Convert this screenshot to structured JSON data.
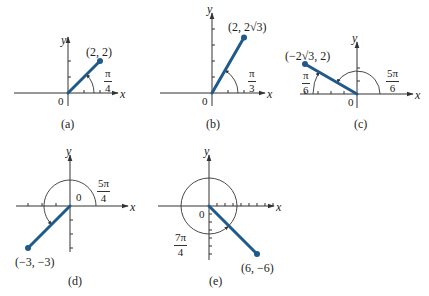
{
  "colors": {
    "ray": "#1f5a8a",
    "axis": "#333333",
    "text": "#222222"
  },
  "panels": [
    {
      "id": "a",
      "caption": "(a)",
      "origin": [
        68,
        93
      ],
      "unit": 16,
      "x_axis": [
        14,
        118
      ],
      "y_axis": [
        37,
        106
      ],
      "x_ticks": [
        1,
        2
      ],
      "y_ticks": [
        1,
        2
      ],
      "point": [
        2,
        2
      ],
      "point_label": "(2, 2)",
      "angle": {
        "num": "π",
        "den": "4",
        "start_deg": 0,
        "end_deg": 45,
        "radius": 26,
        "dir": "ccw",
        "full_circle": false
      },
      "labels": {
        "x": [
          120,
          88
        ],
        "y": [
          61,
          34
        ],
        "zero": [
          58,
          96
        ],
        "point": [
          86,
          46
        ],
        "angle": [
          104,
          68
        ],
        "caption": [
          61,
          118
        ]
      }
    },
    {
      "id": "b",
      "caption": "(b)",
      "origin": [
        212,
        93
      ],
      "unit": 16,
      "x_axis": [
        160,
        265
      ],
      "y_axis": [
        13,
        106
      ],
      "x_ticks": [
        1,
        2
      ],
      "y_ticks": [
        1,
        2,
        3,
        4
      ],
      "point": [
        2,
        3.464
      ],
      "point_label": "(2, 2√3)",
      "angle": {
        "num": "π",
        "den": "3",
        "start_deg": 0,
        "end_deg": 60,
        "radius": 26,
        "dir": "ccw",
        "full_circle": false
      },
      "labels": {
        "x": [
          267,
          88
        ],
        "y": [
          207,
          3
        ],
        "zero": [
          202,
          96
        ],
        "point": [
          228,
          21
        ],
        "angle": [
          248,
          68
        ],
        "caption": [
          206,
          118
        ]
      }
    },
    {
      "id": "c",
      "caption": "(c)",
      "origin": [
        357,
        94
      ],
      "unit": 13,
      "x_axis": [
        300,
        413
      ],
      "y_axis": [
        42,
        108
      ],
      "x_ticks": [
        -1,
        -2,
        -3,
        -4
      ],
      "y_ticks": [
        1,
        2
      ],
      "point": [
        -4,
        2.31
      ],
      "point_label": "(−2√3, 2)",
      "angle_small": {
        "num": "π",
        "den": "6",
        "start_deg": 180,
        "end_deg": 150,
        "radius": 44
      },
      "angle": {
        "num": "5π",
        "den": "6",
        "start_deg": 0,
        "end_deg": 150,
        "radius": 23,
        "dir": "ccw",
        "full_circle": false
      },
      "labels": {
        "x": [
          415,
          89
        ],
        "y": [
          352,
          32
        ],
        "zero": [
          348,
          97
        ],
        "point": [
          285,
          50
        ],
        "angle": [
          386,
          68
        ],
        "angle_small": [
          302,
          70
        ],
        "caption": [
          354,
          118
        ]
      }
    },
    {
      "id": "d",
      "caption": "(d)",
      "origin": [
        70,
        206
      ],
      "unit": 14,
      "x_axis": [
        16,
        128
      ],
      "y_axis": [
        155,
        252
      ],
      "x_ticks": [
        -1,
        -2,
        -3
      ],
      "y_ticks": [
        -1,
        -2,
        -3
      ],
      "point": [
        -3,
        -3
      ],
      "point_label": "(−3, −3)",
      "angle": {
        "num": "5π",
        "den": "4",
        "start_deg": 0,
        "end_deg": 225,
        "radius": 26,
        "dir": "ccw",
        "full_circle": false
      },
      "labels": {
        "x": [
          130,
          201
        ],
        "y": [
          66,
          145
        ],
        "zero": [
          76,
          192
        ],
        "point": [
          15,
          256
        ],
        "angle": [
          97,
          178
        ],
        "caption": [
          68,
          275
        ]
      }
    },
    {
      "id": "e",
      "caption": "(e)",
      "origin": [
        209,
        206
      ],
      "unit": 8,
      "x_axis": [
        158,
        274
      ],
      "y_axis": [
        155,
        260
      ],
      "x_ticks": [
        1,
        2,
        3,
        4,
        5,
        6,
        7,
        8
      ],
      "y_ticks": [
        -1,
        -2,
        -3,
        -4,
        -5,
        -6
      ],
      "point": [
        6,
        -6
      ],
      "point_label": "(6, −6)",
      "angle": {
        "num": "7π",
        "den": "4",
        "start_deg": 0,
        "end_deg": 315,
        "radius": 28,
        "dir": "ccw",
        "full_circle": true
      },
      "labels": {
        "x": [
          276,
          201
        ],
        "y": [
          204,
          145
        ],
        "zero": [
          199,
          209
        ],
        "point": [
          241,
          262
        ],
        "angle": [
          174,
          232
        ],
        "caption": [
          209,
          275
        ]
      }
    }
  ]
}
